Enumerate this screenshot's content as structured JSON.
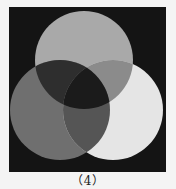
{
  "figure": {
    "caption": "（4）",
    "background_color": "#141414",
    "page_color": "#f4f4f4",
    "frame": {
      "x": 9,
      "y": 7,
      "width": 157,
      "height": 165
    }
  },
  "venn": {
    "circles": [
      {
        "id": "top",
        "cx": 84,
        "cy": 60,
        "r": 49,
        "fill": "#a9a9a9"
      },
      {
        "id": "left",
        "cx": 60,
        "cy": 110,
        "r": 50,
        "fill": "#6f6f6f"
      },
      {
        "id": "right",
        "cx": 113,
        "cy": 110,
        "r": 50,
        "fill": "#e5e5e5"
      }
    ],
    "regions": {
      "top_only": "#a9a9a9",
      "left_only": "#6f6f6f",
      "right_only": "#e5e5e5",
      "top_and_left": "#2e2e2e",
      "top_and_right": "#8b8b8b",
      "left_and_right": "#555555",
      "all_three": "#1b1b1b"
    }
  }
}
